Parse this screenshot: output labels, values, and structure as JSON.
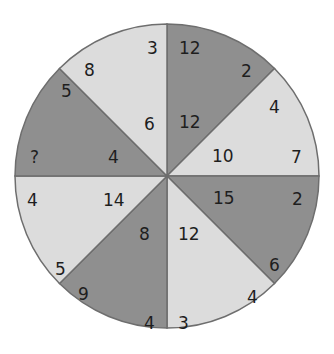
{
  "puzzle": {
    "type": "number-wheel",
    "colors": {
      "dark": "#8f8f8f",
      "light": "#dcdcdc",
      "stroke": "#6e6e6e"
    },
    "segments": [
      {
        "name": "top-right",
        "shade": "dark",
        "outer_a": "12",
        "outer_b": "2",
        "inner": "12"
      },
      {
        "name": "right-upper",
        "shade": "light",
        "outer_a": "4",
        "outer_b": "7",
        "inner": "10"
      },
      {
        "name": "right-lower",
        "shade": "dark",
        "outer_a": "2",
        "outer_b": "6",
        "inner": "15"
      },
      {
        "name": "bottom-right",
        "shade": "light",
        "outer_a": "4",
        "outer_b": "3",
        "inner": "12"
      },
      {
        "name": "bottom-left",
        "shade": "dark",
        "outer_a": "4",
        "outer_b": "9",
        "inner": "8"
      },
      {
        "name": "left-lower",
        "shade": "light",
        "outer_a": "5",
        "outer_b": "4",
        "inner": "14"
      },
      {
        "name": "left-upper",
        "shade": "dark",
        "outer_a": "?",
        "outer_b": "5",
        "inner": "4"
      },
      {
        "name": "top-left",
        "shade": "light",
        "outer_a": "8",
        "outer_b": "3",
        "inner": "6"
      }
    ]
  }
}
